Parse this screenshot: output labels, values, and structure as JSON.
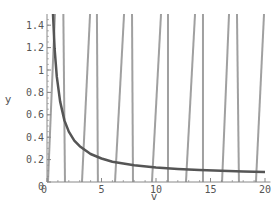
{
  "chart_data": {
    "type": "line",
    "title": "",
    "xlabel": "v",
    "ylabel": "y",
    "xlim": [
      0,
      20.5
    ],
    "ylim": [
      0,
      1.5
    ],
    "grid": false,
    "legend": null,
    "x_ticks": [
      0,
      5,
      10,
      15,
      20
    ],
    "x_tick_labels": [
      "0",
      "5",
      "10",
      "15",
      "20"
    ],
    "y_ticks": [
      0,
      0.2,
      0.4,
      0.6,
      0.8,
      1,
      1.2,
      1.4
    ],
    "y_tick_labels": [
      "0",
      "0.2",
      "0.4",
      "0.6",
      "0.8",
      "1",
      "1.2",
      "1.4"
    ],
    "series": [
      {
        "name": "decaying curve",
        "color": "#555555",
        "width": 2.5,
        "formula": "y ≈ 0.05 + 0.8/v",
        "x": [
          0.55,
          0.7,
          0.9,
          1.2,
          1.6,
          2,
          2.5,
          3,
          4,
          5,
          6,
          8,
          10,
          12,
          14,
          16,
          18,
          20
        ],
        "values": [
          1.5,
          1.19,
          0.94,
          0.72,
          0.55,
          0.45,
          0.37,
          0.32,
          0.25,
          0.21,
          0.18,
          0.15,
          0.13,
          0.117,
          0.107,
          0.1,
          0.094,
          0.09
        ]
      },
      {
        "name": "slanted branches",
        "color": "#a0a0a0",
        "width": 2,
        "segments": [
          {
            "x0": 0.09,
            "y0": 0,
            "x1": 0.73,
            "y1": 1.5
          },
          {
            "x0": 3.21,
            "y0": 0,
            "x1": 3.95,
            "y1": 1.5
          },
          {
            "x0": 6.24,
            "y0": 0,
            "x1": 7.07,
            "y1": 1.5
          },
          {
            "x0": 9.63,
            "y0": 0,
            "x1": 10.46,
            "y1": 1.5
          },
          {
            "x0": 12.75,
            "y0": 0,
            "x1": 13.58,
            "y1": 1.5
          },
          {
            "x0": 16.06,
            "y0": 0,
            "x1": 16.7,
            "y1": 1.5
          },
          {
            "x0": 19.17,
            "y0": 0,
            "x1": 19.91,
            "y1": 1.5
          }
        ]
      },
      {
        "name": "vertical branches",
        "color": "#a0a0a0",
        "width": 2,
        "segments": [
          {
            "x0": 1.65,
            "y0": 0,
            "x1": 1.5,
            "y1": 1.5
          },
          {
            "x0": 4.67,
            "y0": 0,
            "x1": 4.58,
            "y1": 1.5
          },
          {
            "x0": 7.89,
            "y0": 0,
            "x1": 7.8,
            "y1": 1.5
          },
          {
            "x0": 11.1,
            "y0": 0,
            "x1": 11.1,
            "y1": 1.5
          },
          {
            "x0": 14.31,
            "y0": 0,
            "x1": 14.31,
            "y1": 1.5
          },
          {
            "x0": 17.61,
            "y0": 0,
            "x1": 17.43,
            "y1": 1.5
          }
        ]
      }
    ]
  },
  "layout": {
    "origin_px": [
      47,
      182
    ],
    "px_per_x": 10.9,
    "px_per_y": 112,
    "axis_color": "#888888"
  }
}
